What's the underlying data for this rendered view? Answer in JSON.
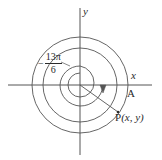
{
  "figure": {
    "type": "coordinate-plane-angle-diagram",
    "stroke_color": "#555555",
    "text_color": "#2b2b2b",
    "background": "#ffffff",
    "axes": {
      "x_label": "x",
      "y_label": "y",
      "origin": [
        80,
        85
      ],
      "x_axis_extent": [
        8,
        152
      ],
      "y_axis_extent": [
        8,
        155
      ]
    },
    "angle": {
      "sign": "−",
      "numerator": "13π",
      "denominator": "6",
      "full_label": "−13π/6",
      "direction": "clockwise",
      "terminal_point_label_prefix": "P",
      "terminal_point_coords_text": "(x, y)"
    },
    "points": [
      {
        "name": "A",
        "label": "A",
        "position": [
          128,
          85
        ]
      },
      {
        "name": "P",
        "label": "P(x, y)",
        "position": [
          118,
          112
        ]
      }
    ],
    "circles": [
      {
        "name": "outer-circle",
        "center": [
          80,
          85
        ],
        "radius": 48
      },
      {
        "name": "middle-circle",
        "center": [
          80,
          85
        ],
        "radius": 37
      },
      {
        "name": "inner-spiral-arc",
        "center": [
          80,
          85
        ],
        "radius": 23
      },
      {
        "name": "innermost-arc",
        "center": [
          80,
          85
        ],
        "radius": 12
      }
    ]
  }
}
